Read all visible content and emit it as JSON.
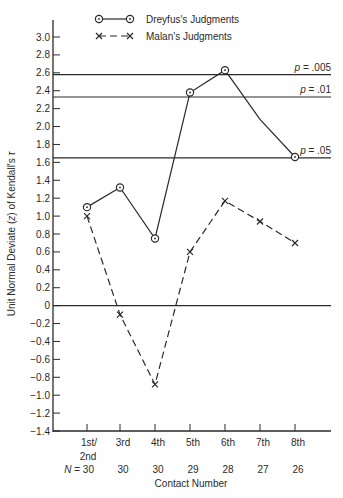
{
  "chart_data": {
    "type": "line",
    "title": "",
    "xlabel": "Contact Number",
    "ylabel": "Unit Normal Deviate (z) of Kendall's τ",
    "categories": [
      "1st/2nd",
      "3rd",
      "4th",
      "5th",
      "6th",
      "7th",
      "8th"
    ],
    "n_label": "N = 30",
    "n_values": [
      "30",
      "30",
      "30",
      "29",
      "28",
      "27",
      "26"
    ],
    "ylim": [
      -1.4,
      3.0
    ],
    "yticks": [
      "3.0",
      "2.8",
      "2.6",
      "2.4",
      "2.2",
      "2.0",
      "1.8",
      "1.6",
      "1.4",
      "1.2",
      "1.0",
      "0.8",
      "0.6",
      "0.4",
      "0.2",
      "0",
      "-0.2",
      "-0.4",
      "-0.6",
      "-0.8",
      "-1.0",
      "-1.2",
      "-1.4"
    ],
    "series": [
      {
        "name": "Dreyfus's Judgments",
        "style": "solid",
        "marker": "circle-dot",
        "values": [
          1.1,
          1.32,
          0.75,
          2.38,
          2.63,
          2.08,
          1.66
        ],
        "markers_shown": [
          true,
          true,
          true,
          true,
          true,
          false,
          true
        ]
      },
      {
        "name": "Malan's Judgments",
        "style": "dashed",
        "marker": "x",
        "values": [
          1.0,
          -0.1,
          -0.88,
          0.6,
          1.17,
          0.94,
          0.7
        ],
        "markers_shown": [
          true,
          true,
          true,
          true,
          true,
          true,
          true
        ]
      }
    ],
    "reference_lines": [
      {
        "y": 2.58,
        "label": "p = .005"
      },
      {
        "y": 2.33,
        "label": "p = .01"
      },
      {
        "y": 1.65,
        "label": "p = .05"
      },
      {
        "y": 0,
        "label": ""
      }
    ],
    "grid": false,
    "legend_position": "top"
  },
  "legend": {
    "dreyfus": "Dreyfus's Judgments",
    "malan": "Malan's Judgments"
  },
  "labels": {
    "p005": "p = .005",
    "p01": "p = .01",
    "p05": "p = .05",
    "xlabel": "Contact Number",
    "ylabel": "Unit Normal Deviate (z) of Kendall's τ",
    "n_prefix": "N = 30"
  }
}
